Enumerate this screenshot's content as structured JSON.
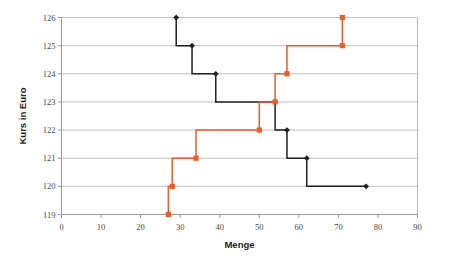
{
  "chart_data": {
    "type": "line",
    "title": "",
    "xlabel": "Menge",
    "ylabel": "Kurs in Euro",
    "xlim": [
      0,
      90
    ],
    "ylim": [
      119,
      126
    ],
    "xticks": [
      0,
      10,
      20,
      30,
      40,
      50,
      60,
      70,
      80,
      90
    ],
    "yticks": [
      119,
      120,
      121,
      122,
      123,
      124,
      125,
      126
    ],
    "grid": "horizontal",
    "legend": "none",
    "step_mode": "post",
    "series": [
      {
        "name": "Nachfrage",
        "color": "#231f20",
        "marker": "diamond",
        "points": [
          {
            "x": 29,
            "y": 126
          },
          {
            "x": 33,
            "y": 125
          },
          {
            "x": 39,
            "y": 124
          },
          {
            "x": 54,
            "y": 123
          },
          {
            "x": 57,
            "y": 122
          },
          {
            "x": 62,
            "y": 121
          },
          {
            "x": 77,
            "y": 120
          }
        ]
      },
      {
        "name": "Angebot",
        "color": "#ef5a28",
        "marker": "square",
        "points": [
          {
            "x": 27,
            "y": 119
          },
          {
            "x": 28,
            "y": 120
          },
          {
            "x": 34,
            "y": 121
          },
          {
            "x": 50,
            "y": 122
          },
          {
            "x": 54,
            "y": 123
          },
          {
            "x": 57,
            "y": 124
          },
          {
            "x": 71,
            "y": 125
          },
          {
            "x": 71,
            "y": 126
          }
        ]
      }
    ]
  },
  "ticks": {
    "x": [
      "0",
      "10",
      "20",
      "30",
      "40",
      "50",
      "60",
      "70",
      "80",
      "90"
    ],
    "y": [
      "119",
      "120",
      "121",
      "122",
      "123",
      "124",
      "125",
      "126"
    ]
  },
  "labels": {
    "x_axis_title": "Menge",
    "y_axis_title": "Kurs in Euro"
  },
  "colors": {
    "demand_line": "#231f20",
    "supply_line": "#ef5a28",
    "grid": "#b9b9b9",
    "axis": "#9a9a9a",
    "background": "#ffffff",
    "tick_label": "#4a4a4a"
  }
}
